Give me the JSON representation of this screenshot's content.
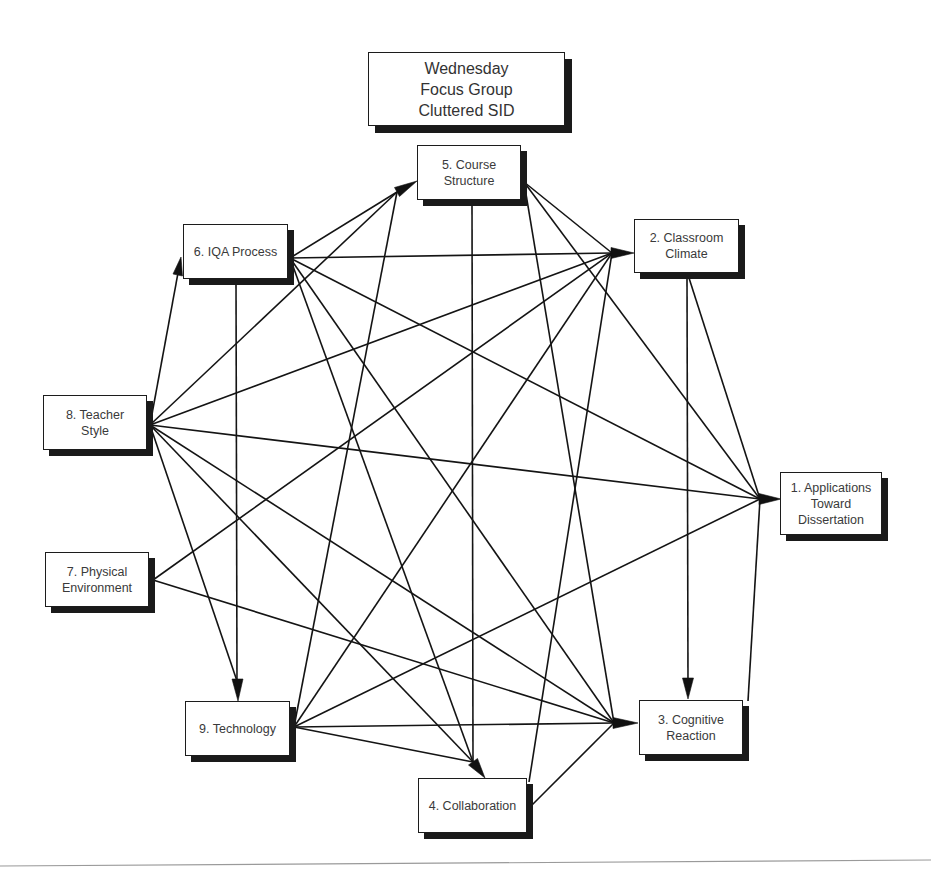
{
  "title": {
    "lines": [
      "Wednesday",
      "Focus Group",
      "Cluttered SID"
    ]
  },
  "nodes": {
    "n1": {
      "id": 1,
      "lines": [
        "1. Applications",
        "Toward",
        "Dissertation"
      ]
    },
    "n2": {
      "id": 2,
      "lines": [
        "2. Classroom",
        "Climate"
      ]
    },
    "n3": {
      "id": 3,
      "lines": [
        "3. Cognitive",
        "Reaction"
      ]
    },
    "n4": {
      "id": 4,
      "lines": [
        "4. Collaboration"
      ]
    },
    "n5": {
      "id": 5,
      "lines": [
        "5. Course",
        "Structure"
      ]
    },
    "n6": {
      "id": 6,
      "lines": [
        "6. IQA Process"
      ]
    },
    "n7": {
      "id": 7,
      "lines": [
        "7. Physical",
        "Environment"
      ]
    },
    "n8": {
      "id": 8,
      "lines": [
        "8. Teacher",
        "Style"
      ]
    },
    "n9": {
      "id": 9,
      "lines": [
        "9. Technology"
      ]
    }
  },
  "edges": [
    {
      "from": 6,
      "to": 5
    },
    {
      "from": 6,
      "to": 2
    },
    {
      "from": 6,
      "to": 1
    },
    {
      "from": 6,
      "to": 3
    },
    {
      "from": 6,
      "to": 4
    },
    {
      "from": 6,
      "to": 9
    },
    {
      "from": 8,
      "to": 6
    },
    {
      "from": 8,
      "to": 5
    },
    {
      "from": 8,
      "to": 2
    },
    {
      "from": 8,
      "to": 1
    },
    {
      "from": 8,
      "to": 3
    },
    {
      "from": 8,
      "to": 4
    },
    {
      "from": 8,
      "to": 9
    },
    {
      "from": 7,
      "to": 2
    },
    {
      "from": 7,
      "to": 3
    },
    {
      "from": 9,
      "to": 5
    },
    {
      "from": 9,
      "to": 2
    },
    {
      "from": 9,
      "to": 1
    },
    {
      "from": 9,
      "to": 3
    },
    {
      "from": 9,
      "to": 4
    },
    {
      "from": 5,
      "to": 2
    },
    {
      "from": 5,
      "to": 1
    },
    {
      "from": 5,
      "to": 3
    },
    {
      "from": 5,
      "to": 4
    },
    {
      "from": 2,
      "to": 1
    },
    {
      "from": 2,
      "to": 3
    },
    {
      "from": 4,
      "to": 2
    },
    {
      "from": 4,
      "to": 3
    },
    {
      "from": 3,
      "to": 1
    }
  ]
}
